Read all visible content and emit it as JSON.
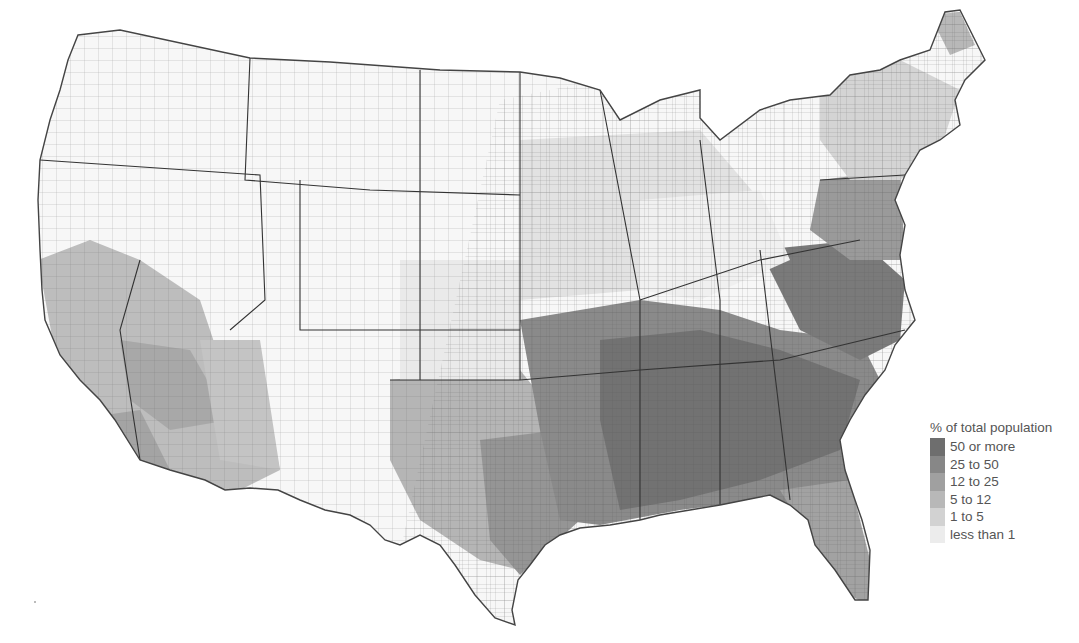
{
  "map": {
    "subject": "US counties choropleth",
    "background": "#ffffff",
    "outline_color": "#555555"
  },
  "legend": {
    "title": "% of total population",
    "items": [
      {
        "label": "50 or more",
        "color": "#6e6e6e"
      },
      {
        "label": "25 to 50",
        "color": "#878787"
      },
      {
        "label": "12 to 25",
        "color": "#a0a0a0"
      },
      {
        "label": "5 to 12",
        "color": "#b8b8b8"
      },
      {
        "label": "1 to 5",
        "color": "#d2d2d2"
      },
      {
        "label": "less than 1",
        "color": "#ececec"
      }
    ]
  },
  "regions": [
    {
      "name": "pacific-northwest",
      "class": "less than 1"
    },
    {
      "name": "california-coast",
      "class": "5 to 12"
    },
    {
      "name": "southwest-arizona",
      "class": "5 to 12"
    },
    {
      "name": "mountain-west",
      "class": "less than 1"
    },
    {
      "name": "great-plains",
      "class": "less than 1"
    },
    {
      "name": "texas-east",
      "class": "12 to 25"
    },
    {
      "name": "texas-west",
      "class": "1 to 5"
    },
    {
      "name": "midwest",
      "class": "1 to 5"
    },
    {
      "name": "great-lakes",
      "class": "1 to 5"
    },
    {
      "name": "northeast",
      "class": "5 to 12"
    },
    {
      "name": "new-england-north",
      "class": "less than 1"
    },
    {
      "name": "mid-atlantic-coast",
      "class": "25 to 50"
    },
    {
      "name": "appalachia",
      "class": "1 to 5"
    },
    {
      "name": "deep-south",
      "class": "50 or more"
    },
    {
      "name": "south-central",
      "class": "25 to 50"
    },
    {
      "name": "florida",
      "class": "12 to 25"
    }
  ]
}
